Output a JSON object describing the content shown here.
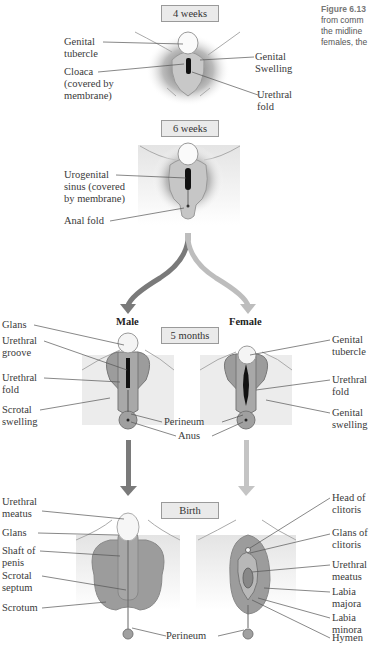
{
  "caption": {
    "figure_label": "Figure 6.13",
    "lines": [
      "from comm",
      "the midline",
      "females, the"
    ]
  },
  "stages": {
    "week4": "4 weeks",
    "week6": "6 weeks",
    "month5": "5 months",
    "birth": "Birth"
  },
  "sexes": {
    "male": "Male",
    "female": "Female"
  },
  "labels_week4": {
    "genital_tubercle": "Genital\ntubercle",
    "cloaca": "Cloaca\n(covered by\nmembrane)",
    "genital_swelling": "Genital\nSwelling",
    "urethral_fold": "Urethral\nfold"
  },
  "labels_week6": {
    "urogenital_sinus": "Urogenital\nsinus (covered\nby membrane)",
    "anal_fold": "Anal fold"
  },
  "labels_month5_male": {
    "glans": "Glans",
    "urethral_groove": "Urethral\ngroove",
    "urethral_fold": "Urethral\nfold",
    "scrotal_swelling": "Scrotal\nswelling"
  },
  "labels_month5_shared": {
    "perineum": "Perineum",
    "anus": "Anus"
  },
  "labels_month5_female": {
    "genital_tubercle": "Genital\ntubercle",
    "urethral_fold": "Urethral\nfold",
    "genital_swelling": "Genital\nswelling"
  },
  "labels_birth_male": {
    "urethral_meatus": "Urethral\nmeatus",
    "glans": "Glans",
    "shaft": "Shaft of\npenis",
    "scrotal_septum": "Scrotal\nseptum",
    "scrotum": "Scrotum"
  },
  "labels_birth_shared": {
    "perineum": "Perineum"
  },
  "labels_birth_female": {
    "head_clitoris": "Head of\nclitoris",
    "glans_clitoris": "Glans of\nclitoris",
    "urethral_meatus": "Urethral\nmeatus",
    "labia_majora": "Labia\nmajora",
    "labia_minora": "Labia\nminora",
    "hymen": "Hymen"
  },
  "colors": {
    "male_arrow": "#7a7a7a",
    "female_arrow": "#bdbdbd",
    "tissue": "#9c9c9c",
    "skin": "#e6e6e6",
    "stage_box": "#eaeaea"
  }
}
